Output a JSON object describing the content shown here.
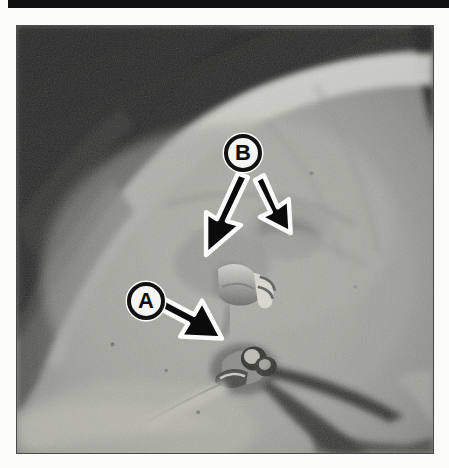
{
  "figure": {
    "type": "photograph",
    "caption": "",
    "frame_border_color": "#4a4a4a",
    "top_rule_color": "#111111",
    "background_color": "#fcfcfa"
  },
  "callouts": [
    {
      "id": "callout-a",
      "label": "A",
      "label_color": "#0d0d0d",
      "circle_fill": "#f4f4f2",
      "circle_ring": "#111111",
      "center": {
        "x": 145,
        "y": 300
      },
      "arrow_tip": {
        "x": 215,
        "y": 337
      },
      "points_to": "hose connector fitting"
    },
    {
      "id": "callout-b",
      "label": "B",
      "label_color": "#0d0d0d",
      "circle_fill": "#f4f4f2",
      "circle_ring": "#111111",
      "center": {
        "x": 242,
        "y": 152
      },
      "arrows": [
        {
          "tip": {
            "x": 207,
            "y": 253
          },
          "points_to": "upper vacuum port"
        },
        {
          "tip": {
            "x": 287,
            "y": 228
          },
          "points_to": "right vacuum port"
        }
      ]
    }
  ],
  "arrow_style": {
    "fill": "#0b0b0b",
    "outline": "#fbfbfb",
    "outline_width": 4
  },
  "photo_tones": {
    "shadow": "#2c2c2a",
    "dark": "#4a4a46",
    "mid": "#8d8d88",
    "light": "#b9b9b3",
    "highlight": "#d6d6cf"
  }
}
